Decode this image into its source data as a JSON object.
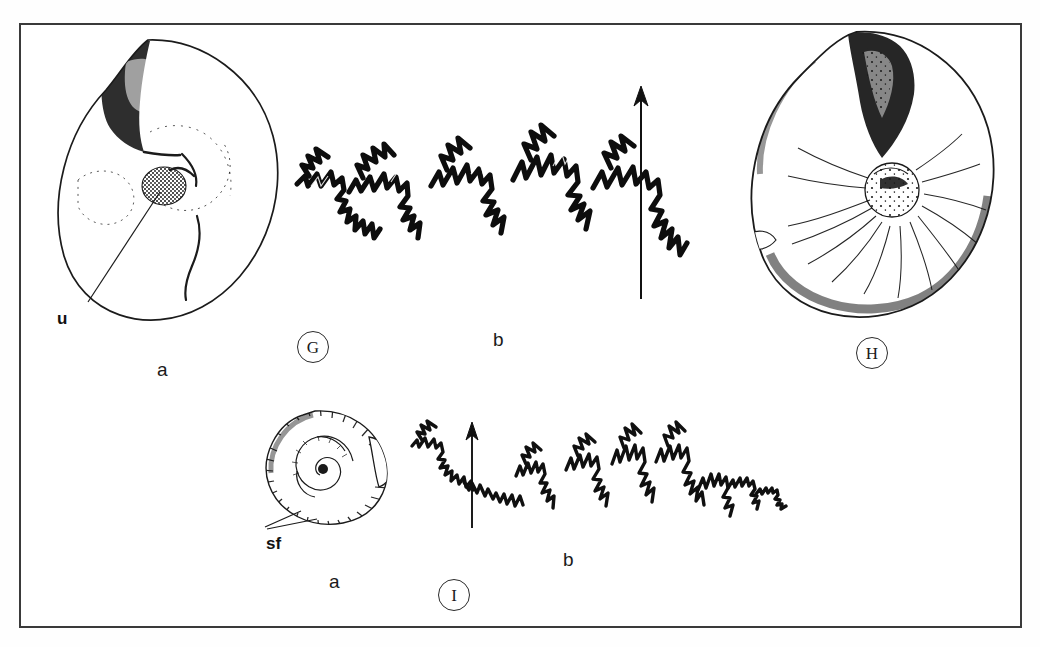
{
  "plate": {
    "background": "#ffffff",
    "frame_color": "#3a3a3a",
    "ink_color": "#1b1b1b"
  },
  "figures": [
    {
      "id": "G",
      "circle_label": "G",
      "parts": [
        {
          "key": "a",
          "sublabel": "a",
          "kind": "shell-lateral-view",
          "description": "involute ammonite shell, lateral view, stippled",
          "annotations": [
            {
              "text": "u",
              "meaning": "umbilicus"
            }
          ]
        },
        {
          "key": "b",
          "sublabel": "b",
          "kind": "suture-line",
          "description": "ammonitic suture line, stippled shading, arrow marks venter",
          "annotations": []
        }
      ]
    },
    {
      "id": "H",
      "circle_label": "H",
      "parts": [
        {
          "key": "a",
          "sublabel": "",
          "kind": "shell-lateral-view",
          "description": "involute ammonite shell with radial striae, lateral view",
          "annotations": []
        }
      ]
    },
    {
      "id": "I",
      "circle_label": "I",
      "parts": [
        {
          "key": "a",
          "sublabel": "a",
          "kind": "shell-lateral-view",
          "description": "small ammonite shell with fine ribbed periphery",
          "annotations": [
            {
              "text": "sf",
              "meaning": "shell folds"
            }
          ]
        },
        {
          "key": "b",
          "sublabel": "b",
          "kind": "suture-line",
          "description": "ammonitic suture line, outline only, arrow marks venter",
          "annotations": []
        }
      ]
    }
  ],
  "labels": {
    "fig_g": "G",
    "fig_h": "H",
    "fig_i": "I",
    "g_a": "a",
    "g_b": "b",
    "i_a": "a",
    "i_b": "b",
    "umbilicus": "u",
    "shell_folds": "sf"
  }
}
